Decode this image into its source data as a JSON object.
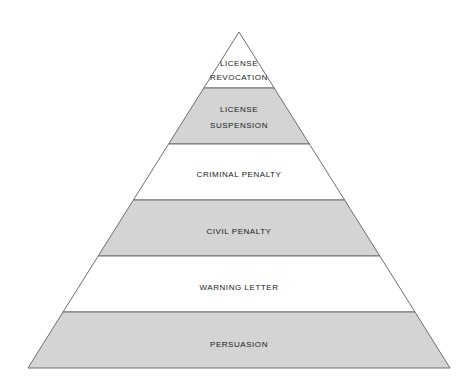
{
  "diagram": {
    "type": "pyramid",
    "orientation": "apex-top",
    "background_color": "#ffffff",
    "outline_color": "#6e6e6e",
    "fill_colors": {
      "shaded": "#d4d4d4",
      "plain": "#ffffff"
    },
    "text_color": "#1a1a1a",
    "geometry": {
      "apex_x": 239,
      "apex_y": 32,
      "base_left_x": 28,
      "base_right_x": 450,
      "base_y": 368,
      "divider_y": [
        88,
        144,
        200,
        256,
        312
      ]
    },
    "tiers": [
      {
        "index": 1,
        "position": "top",
        "label": "LICENSE REVOCATION",
        "line1": "LICENSE",
        "line2": "REVOCATION",
        "fill": "plain",
        "top_y": 32,
        "bottom_y": 88
      },
      {
        "index": 2,
        "position": "second",
        "label": "LICENSE SUSPENSION",
        "line1": "LICENSE",
        "line2": "SUSPENSION",
        "fill": "shaded",
        "top_y": 88,
        "bottom_y": 144
      },
      {
        "index": 3,
        "position": "third",
        "label": "CRIMINAL PENALTY",
        "line1": "CRIMINAL PENALTY",
        "line2": "",
        "fill": "plain",
        "top_y": 144,
        "bottom_y": 200
      },
      {
        "index": 4,
        "position": "fourth",
        "label": "CIVIL PENALTY",
        "line1": "CIVIL PENALTY",
        "line2": "",
        "fill": "shaded",
        "top_y": 200,
        "bottom_y": 256
      },
      {
        "index": 5,
        "position": "fifth",
        "label": "WARNING LETTER",
        "line1": "WARNING LETTER",
        "line2": "",
        "fill": "plain",
        "top_y": 256,
        "bottom_y": 312
      },
      {
        "index": 6,
        "position": "base",
        "label": "PERSUASION",
        "line1": "PERSUASION",
        "line2": "",
        "fill": "shaded",
        "top_y": 312,
        "bottom_y": 368
      }
    ]
  }
}
